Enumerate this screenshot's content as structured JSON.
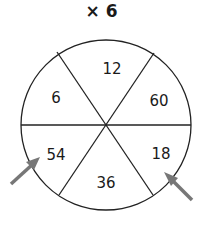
{
  "title": "× 6",
  "segments": [
    {
      "label": "12",
      "position": "top"
    },
    {
      "label": "60",
      "position": "top-right"
    },
    {
      "label": "18",
      "position": "bottom-right"
    },
    {
      "label": "36",
      "position": "bottom"
    },
    {
      "label": "54",
      "position": "bottom-left"
    },
    {
      "label": "6",
      "position": "top-left"
    }
  ],
  "arrows": [
    {
      "points_to": "54",
      "color": "#777777"
    },
    {
      "points_to": "18",
      "color": "#777777"
    }
  ]
}
